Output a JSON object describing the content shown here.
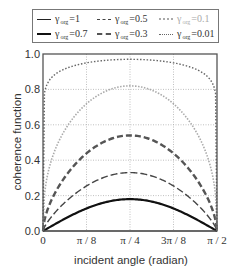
{
  "chart_data": {
    "type": "line",
    "title": "",
    "xlabel": "incident angle (radian)",
    "ylabel": "coherence function",
    "xlim": [
      0,
      1.5708
    ],
    "ylim": [
      0,
      1.0
    ],
    "grid": true,
    "legend_position": "top, above plot",
    "x_ticks": [
      "0",
      "π / 8",
      "π / 4",
      "3π / 8",
      "π / 2"
    ],
    "x_tick_values": [
      0,
      0.3927,
      0.7854,
      1.1781,
      1.5708
    ],
    "y_ticks": [
      "0.0",
      "0.2",
      "0.4",
      "0.6",
      "0.8",
      "1.0"
    ],
    "y_tick_values": [
      0,
      0.2,
      0.4,
      0.6,
      0.8,
      1.0
    ],
    "x": [
      0,
      0.3927,
      0.7854,
      1.1781,
      1.5708
    ],
    "series": [
      {
        "name": "γ_org=1",
        "symbol": "γ",
        "sub": "org",
        "value": "=1",
        "values": [
          0,
          0,
          0,
          0,
          0
        ],
        "peak": 0.0,
        "shape": 1.0,
        "color": "#222222",
        "width": 1.2,
        "dash": "",
        "legend_col": 0,
        "legend_row": 0
      },
      {
        "name": "γ_org=0.7",
        "symbol": "γ",
        "sub": "org",
        "value": "=0.7",
        "values": [
          0,
          0.14,
          0.18,
          0.14,
          0
        ],
        "peak": 0.18,
        "shape": 1.0,
        "color": "#111111",
        "width": 2.2,
        "dash": "",
        "legend_col": 0,
        "legend_row": 1
      },
      {
        "name": "γ_org=0.5",
        "symbol": "γ",
        "sub": "org",
        "value": "=0.5",
        "values": [
          0,
          0.27,
          0.33,
          0.27,
          0
        ],
        "peak": 0.33,
        "shape": 0.75,
        "color": "#444444",
        "width": 1.4,
        "dash": "7 3",
        "legend_col": 1,
        "legend_row": 0
      },
      {
        "name": "γ_org=0.3",
        "symbol": "γ",
        "sub": "org",
        "value": "=0.3",
        "values": [
          0,
          0.48,
          0.54,
          0.48,
          0
        ],
        "peak": 0.54,
        "shape": 0.6,
        "color": "#555555",
        "width": 2.4,
        "dash": "6 3",
        "legend_col": 1,
        "legend_row": 1
      },
      {
        "name": "γ_org=0.1",
        "symbol": "γ",
        "sub": "org",
        "value": "=0.1",
        "values": [
          0,
          0.7,
          0.82,
          0.7,
          0
        ],
        "peak": 0.82,
        "shape": 0.38,
        "color": "#aaaaaa",
        "width": 1.6,
        "dash": "1.5 1.5",
        "legend_col": 2,
        "legend_row": 0
      },
      {
        "name": "γ_org=0.01",
        "symbol": "γ",
        "sub": "org",
        "value": "=0.01",
        "values": [
          0,
          0.96,
          0.97,
          0.96,
          0
        ],
        "peak": 0.97,
        "shape": 0.06,
        "color": "#666666",
        "width": 1.4,
        "dash": "1.5 1.8",
        "legend_col": 2,
        "legend_row": 1
      }
    ]
  },
  "plot_area": {
    "left": 43,
    "top": 54,
    "right": 217,
    "bottom": 231
  },
  "colors": {
    "frame": "#555555",
    "grid": "#b0b0b0",
    "background": "#ffffff"
  }
}
